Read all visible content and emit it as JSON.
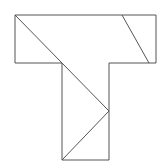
{
  "diagram": {
    "title": "",
    "stroke_color": "#555555",
    "background": "#ffffff",
    "outline": {
      "name": "T-shape outline",
      "points": [
        [
          15,
          15
        ],
        [
          156,
          15
        ],
        [
          156,
          63
        ],
        [
          109,
          63
        ],
        [
          109,
          160
        ],
        [
          62,
          160
        ],
        [
          62,
          63
        ],
        [
          15,
          63
        ]
      ]
    },
    "internal_lines": [
      {
        "name": "long-diagonal",
        "from": [
          15,
          15
        ],
        "to": [
          109,
          111
        ]
      },
      {
        "name": "lower-diagonal",
        "from": [
          109,
          111
        ],
        "to": [
          62,
          160
        ]
      },
      {
        "name": "top-right-diagonal",
        "from": [
          122,
          15
        ],
        "to": [
          149,
          63
        ]
      }
    ]
  }
}
